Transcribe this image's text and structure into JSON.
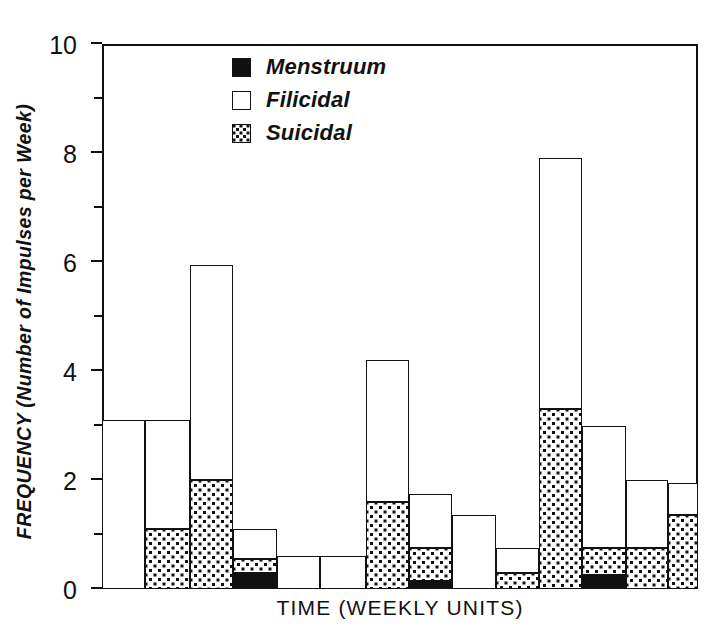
{
  "chart_data": {
    "type": "bar",
    "subtype": "stacked-bar-histogram",
    "title": "",
    "xlabel": "TIME (WEEKLY UNITS)",
    "ylabel": "FREQUENCY (Number of Impulses per Week)",
    "ylim": [
      0,
      10
    ],
    "ytick_labels": [
      "0",
      "2",
      "4",
      "6",
      "8",
      "10"
    ],
    "ytick_values": [
      0,
      2,
      4,
      6,
      8,
      10
    ],
    "yminor_values": [
      1,
      3,
      5,
      7,
      9
    ],
    "grid": false,
    "xtick_labels": [],
    "legend_position": "top-center",
    "series": [
      {
        "name": "Menstruum",
        "fill": "solid-black",
        "values": [
          0,
          0,
          0,
          0.3,
          0,
          0,
          0,
          0.15,
          0,
          0,
          0,
          0.25,
          0,
          0
        ]
      },
      {
        "name": "Suicidal",
        "fill": "stippled",
        "values": [
          0,
          1.1,
          2.0,
          0.25,
          0,
          0,
          1.6,
          0.6,
          0,
          0.3,
          3.3,
          0.5,
          0.75,
          1.35
        ]
      },
      {
        "name": "Filicidal",
        "fill": "white",
        "values": [
          3.1,
          2.0,
          3.95,
          0.55,
          0.6,
          0.6,
          2.6,
          1.0,
          1.35,
          0.45,
          4.6,
          2.25,
          1.25,
          0.6
        ]
      }
    ],
    "bar_totals": [
      3.1,
      3.1,
      5.95,
      1.1,
      0.6,
      0.6,
      4.2,
      1.6,
      1.35,
      0.75,
      7.9,
      3.0,
      2.0,
      1.95
    ],
    "bars": [
      {
        "index": 1,
        "x0": 0.0,
        "x1": 7.2,
        "menstruum": 0,
        "suicidal": 0,
        "filicidal": 3.1,
        "total": 3.1
      },
      {
        "index": 2,
        "x0": 7.2,
        "x1": 14.8,
        "menstruum": 0,
        "suicidal": 1.1,
        "filicidal": 2.0,
        "total": 3.1
      },
      {
        "index": 3,
        "x0": 14.8,
        "x1": 21.9,
        "menstruum": 0,
        "suicidal": 2.0,
        "filicidal": 3.95,
        "total": 5.95
      },
      {
        "index": 4,
        "x0": 21.9,
        "x1": 29.3,
        "menstruum": 0.3,
        "suicidal": 0.25,
        "filicidal": 0.55,
        "total": 1.1
      },
      {
        "index": 5,
        "x0": 29.3,
        "x1": 36.5,
        "menstruum": 0,
        "suicidal": 0,
        "filicidal": 0.6,
        "total": 0.6
      },
      {
        "index": 6,
        "x0": 36.5,
        "x1": 44.3,
        "menstruum": 0,
        "suicidal": 0,
        "filicidal": 0.6,
        "total": 0.6
      },
      {
        "index": 7,
        "x0": 44.3,
        "x1": 51.5,
        "menstruum": 0,
        "suicidal": 1.6,
        "filicidal": 2.6,
        "total": 4.2
      },
      {
        "index": 8,
        "x0": 51.5,
        "x1": 58.8,
        "menstruum": 0.15,
        "suicidal": 0.6,
        "filicidal": 1.0,
        "total": 1.6
      },
      {
        "index": 9,
        "x0": 58.8,
        "x1": 66.1,
        "menstruum": 0,
        "suicidal": 0,
        "filicidal": 1.35,
        "total": 1.35
      },
      {
        "index": 10,
        "x0": 66.1,
        "x1": 73.3,
        "menstruum": 0,
        "suicidal": 0.3,
        "filicidal": 0.45,
        "total": 0.75
      },
      {
        "index": 11,
        "x0": 73.3,
        "x1": 80.6,
        "menstruum": 0,
        "suicidal": 3.3,
        "filicidal": 4.6,
        "total": 7.9
      },
      {
        "index": 12,
        "x0": 80.6,
        "x1": 88.0,
        "menstruum": 0.25,
        "suicidal": 0.5,
        "filicidal": 2.25,
        "total": 3.0
      },
      {
        "index": 13,
        "x0": 88.0,
        "x1": 95.0,
        "menstruum": 0,
        "suicidal": 0.75,
        "filicidal": 1.25,
        "total": 2.0
      },
      {
        "index": 14,
        "x0": 95.0,
        "x1": 100.0,
        "menstruum": 0,
        "suicidal": 1.35,
        "filicidal": 0.6,
        "total": 1.95
      }
    ]
  },
  "legend": {
    "items": [
      {
        "label": "Menstruum",
        "swatch": "solid-black-square-icon"
      },
      {
        "label": "Filicidal",
        "swatch": "white-square-icon"
      },
      {
        "label": "Suicidal",
        "swatch": "stippled-square-icon"
      }
    ]
  },
  "colors": {
    "ink": "#111111",
    "background": "#ffffff"
  }
}
